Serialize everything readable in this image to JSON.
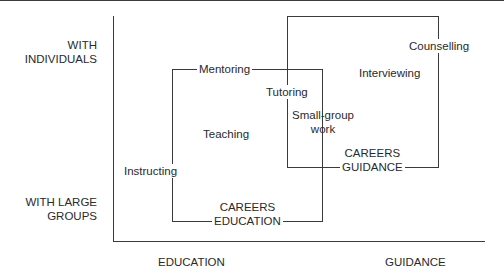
{
  "diagram": {
    "y_axis": {
      "top_label": [
        "WITH",
        "INDIVIDUALS"
      ],
      "bottom_label": [
        "WITH LARGE",
        "GROUPS"
      ]
    },
    "x_axis": {
      "left_label": "EDUCATION",
      "right_label": "GUIDANCE"
    },
    "regions": [
      {
        "name": "CAREERS EDUCATION",
        "lines": [
          "CAREERS",
          "EDUCATION"
        ]
      },
      {
        "name": "CAREERS GUIDANCE",
        "lines": [
          "CAREERS",
          "GUIDANCE"
        ]
      }
    ],
    "activities": {
      "mentoring": "Mentoring",
      "teaching": "Teaching",
      "instructing": "Instructing",
      "tutoring": "Tutoring",
      "small_group": [
        "Small-group",
        "work"
      ],
      "interviewing": "Interviewing",
      "counselling": "Counselling"
    }
  }
}
